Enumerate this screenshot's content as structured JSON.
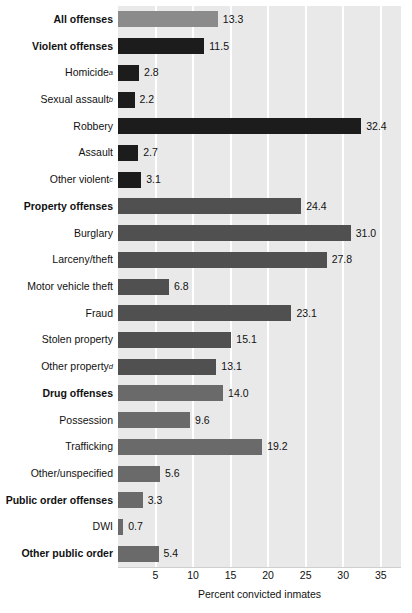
{
  "chart_data": {
    "type": "bar",
    "orientation": "horizontal",
    "title": "",
    "xlabel": "Percent convicted inmates",
    "ylabel": "",
    "xlim": [
      0,
      37.7
    ],
    "xticks": [
      5,
      10,
      15,
      20,
      25,
      30,
      35
    ],
    "xtick_labels": [
      "5",
      "10",
      "15",
      "20",
      "25",
      "30",
      "35"
    ],
    "grid": "vertical-white",
    "legend": "none",
    "categories": [
      "All offenses",
      "Violent offenses",
      "Homicide",
      "Sexual assault",
      "Robbery",
      "Assault",
      "Other violent",
      "Property offenses",
      "Burglary",
      "Larceny/theft",
      "Motor vehicle theft",
      "Fraud",
      "Stolen property",
      "Other property",
      "Drug offenses",
      "Possession",
      "Trafficking",
      "Other/unspecified",
      "Public order offenses",
      "DWI",
      "Other public order"
    ],
    "values": [
      13.3,
      11.5,
      2.8,
      2.2,
      32.4,
      2.7,
      3.1,
      24.4,
      31.0,
      27.8,
      6.8,
      23.1,
      15.1,
      13.1,
      14.0,
      9.6,
      19.2,
      5.6,
      3.3,
      0.7,
      5.4
    ],
    "value_labels": [
      "13.3",
      "11.5",
      "2.8",
      "2.2",
      "32.4",
      "2.7",
      "3.1",
      "24.4",
      "31.0",
      "27.8",
      "6.8",
      "23.1",
      "15.1",
      "13.1",
      "14.0",
      "9.6",
      "19.2",
      "5.6",
      "3.3",
      "0.7",
      "5.4"
    ],
    "footnote_markers": [
      "",
      "",
      "a",
      "b",
      "",
      "",
      "c",
      "",
      "",
      "",
      "",
      "",
      "",
      "d",
      "",
      "",
      "",
      "",
      "",
      "",
      ""
    ],
    "bold_rows": [
      0,
      1,
      7,
      14,
      18,
      20
    ],
    "series_groups": [
      "all",
      "violent",
      "violent",
      "violent",
      "violent",
      "violent",
      "violent",
      "property",
      "property",
      "property",
      "property",
      "property",
      "property",
      "property",
      "drug",
      "drug",
      "drug",
      "drug",
      "public",
      "public",
      "public"
    ],
    "colors": {
      "all": "#8b8b8b",
      "violent": "#1c1c1c",
      "property": "#505050",
      "drug": "#6a6a6a",
      "public": "#6a6a6a",
      "plot_background": "#e9e9e9",
      "gridline": "#ffffff",
      "page_background": "#ffffff",
      "text": "#111111"
    }
  }
}
